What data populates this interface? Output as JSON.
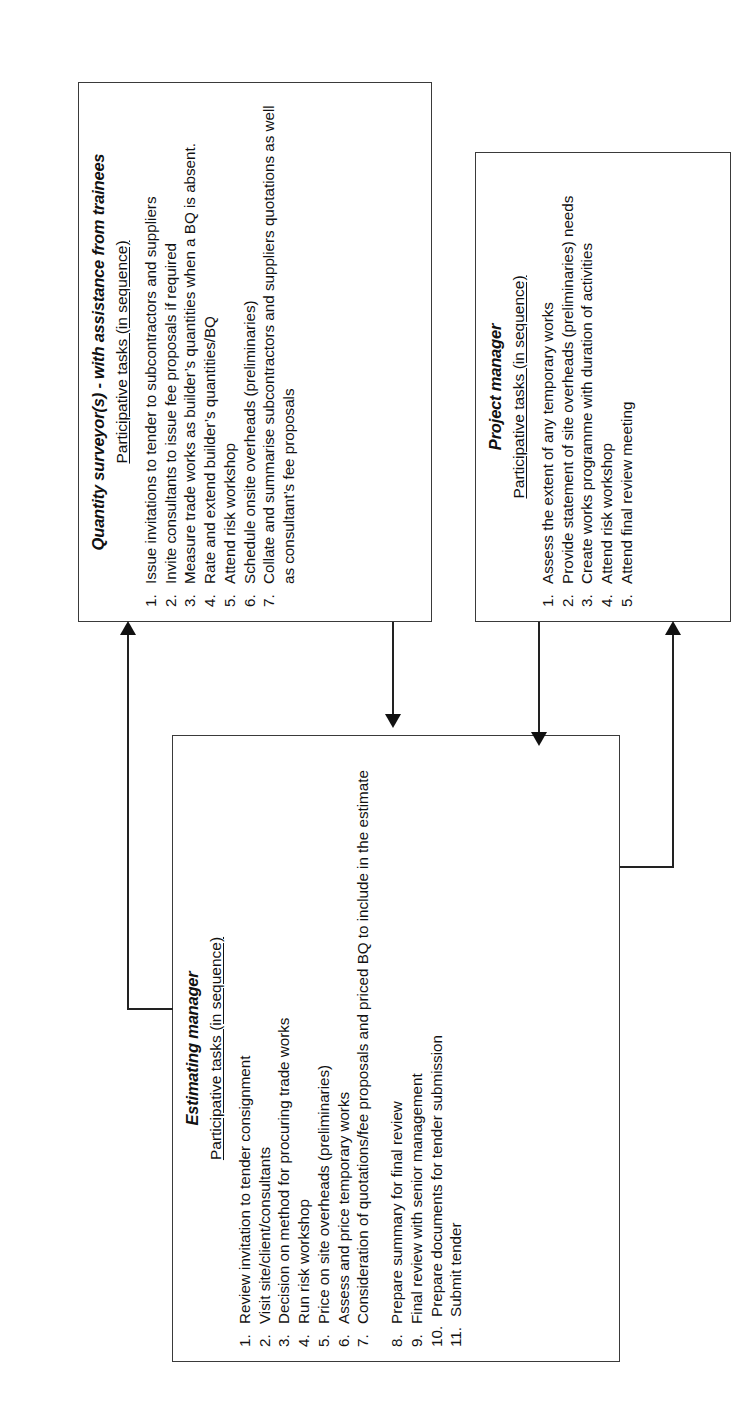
{
  "diagram": {
    "type": "flowchart",
    "orientation": "rotated-90-ccw",
    "boxes": [
      {
        "id": "quantity-surveyor",
        "title": "Quantity surveyor(s) - with assistance from trainees",
        "subtitle": "Participative tasks (in sequence)",
        "tasks": [
          {
            "num": "1.",
            "text": "Issue invitations to tender to subcontractors and suppliers"
          },
          {
            "num": "2.",
            "text": "Invite consultants to issue fee proposals if required"
          },
          {
            "num": "3.",
            "text": "Measure trade works as builder’s quantities when a BQ is absent."
          },
          {
            "num": "4.",
            "text": "Rate and extend builder’s quantities/BQ"
          },
          {
            "num": "5.",
            "text": "Attend risk workshop"
          },
          {
            "num": "6.",
            "text": "Schedule onsite overheads (preliminaries)"
          },
          {
            "num": "7.",
            "text": "Collate and summarise subcontractors and suppliers quotations as well as consultant’s fee proposals"
          }
        ]
      },
      {
        "id": "project-manager",
        "title": "Project manager",
        "subtitle": "Participative tasks (in sequence)",
        "tasks": [
          {
            "num": "1.",
            "text": "Assess the extent of any temporary works"
          },
          {
            "num": "2.",
            "text": "Provide statement of site overheads (preliminaries) needs"
          },
          {
            "num": "3.",
            "text": "Create works programme with duration of activities"
          },
          {
            "num": "4.",
            "text": "Attend risk workshop"
          },
          {
            "num": "5.",
            "text": "Attend final review meeting"
          }
        ]
      },
      {
        "id": "estimating-manager",
        "title": "Estimating manager",
        "subtitle": "Participative tasks (in sequence)",
        "tasks": [
          {
            "num": "1.",
            "text": "Review invitation to tender consignment"
          },
          {
            "num": "2.",
            "text": "Visit site/client/consultants"
          },
          {
            "num": "3.",
            "text": "Decision on method for procuring trade works"
          },
          {
            "num": "4.",
            "text": "Run risk workshop"
          },
          {
            "num": "5.",
            "text": "Price on site overheads (preliminaries)"
          },
          {
            "num": "6.",
            "text": "Assess and price temporary works"
          },
          {
            "num": "7.",
            "text": "Consideration of quotations/fee proposals and priced BQ to include in the estimate"
          },
          {
            "num": "8.",
            "text": "Prepare summary for final review"
          },
          {
            "num": "9.",
            "text": "Final review with senior management"
          },
          {
            "num": "10.",
            "text": "Prepare documents for tender submission"
          },
          {
            "num": "11.",
            "text": "Submit tender"
          }
        ]
      }
    ],
    "connectors": [
      {
        "id": "estimating-to-qs",
        "from": "estimating-manager",
        "to": "quantity-surveyor",
        "arrowhead": "right"
      },
      {
        "id": "qs-to-estimating",
        "from": "quantity-surveyor",
        "to": "estimating-manager",
        "arrowhead": "left"
      },
      {
        "id": "estimating-to-pm",
        "from": "estimating-manager",
        "to": "project-manager",
        "arrowhead": "right"
      },
      {
        "id": "pm-to-estimating",
        "from": "project-manager",
        "to": "estimating-manager",
        "arrowhead": "down"
      }
    ],
    "colors": {
      "border": "#3a3a3a",
      "line": "#222222",
      "text": "#111111",
      "background": "#ffffff"
    }
  }
}
